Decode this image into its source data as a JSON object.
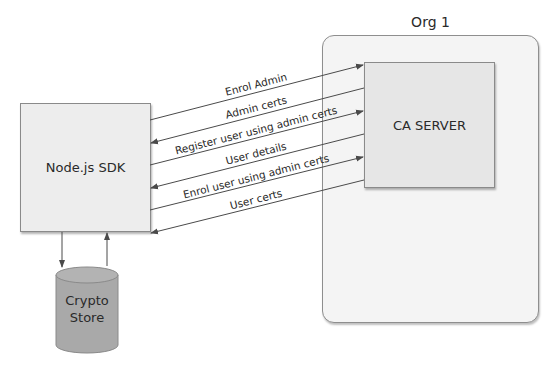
{
  "diagram": {
    "org": {
      "label": "Org 1"
    },
    "ca_server": {
      "label": "CA SERVER"
    },
    "sdk": {
      "label": "Node.js SDK"
    },
    "crypto_store": {
      "line1": "Crypto",
      "line2": "Store"
    },
    "messages": [
      {
        "label": "Enrol Admin",
        "direction": "to-ca"
      },
      {
        "label": "Admin certs",
        "direction": "to-sdk"
      },
      {
        "label": "Register user using admin certs",
        "direction": "to-ca"
      },
      {
        "label": "User details",
        "direction": "to-sdk"
      },
      {
        "label": "Enrol user using admin certs",
        "direction": "to-ca"
      },
      {
        "label": "User certs",
        "direction": "to-sdk"
      }
    ],
    "colors": {
      "line": "#4a4a4a",
      "org_fill": "#f4f4f4",
      "ca_fill": "#e6e6e6",
      "sdk_fill": "#ededed",
      "cylinder_fill": "#a9a9a9"
    }
  }
}
